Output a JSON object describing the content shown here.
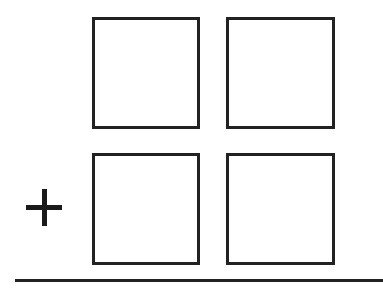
{
  "diagram": {
    "type": "vertical-addition-template",
    "operator": "+",
    "rows": [
      {
        "boxes": [
          "",
          ""
        ]
      },
      {
        "boxes": [
          "",
          ""
        ]
      }
    ],
    "answer_line": true,
    "colors": {
      "stroke": "#222222",
      "background": "#ffffff"
    }
  }
}
